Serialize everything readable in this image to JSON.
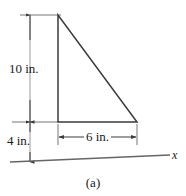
{
  "figure": {
    "caption": "(a)",
    "axis_label": "x",
    "shape": "right triangle",
    "dimensions": [
      {
        "id": "height",
        "label": "10 in.",
        "value": 10,
        "unit": "in.",
        "orientation": "vertical"
      },
      {
        "id": "offset",
        "label": "4 in.",
        "value": 4,
        "unit": "in.",
        "orientation": "vertical"
      },
      {
        "id": "base",
        "label": "6 in.",
        "value": 6,
        "unit": "in.",
        "orientation": "horizontal"
      }
    ],
    "colors": {
      "outline": "#3a3a3a",
      "dimension_line": "#555555",
      "text": "#1a1a1a",
      "background": "#ffffff"
    },
    "geometry": {
      "apex": [
        58,
        15
      ],
      "bottom_left": [
        58,
        122
      ],
      "bottom_right": [
        137,
        122
      ],
      "axis_start": [
        10,
        162
      ],
      "axis_end": [
        170,
        155
      ]
    }
  }
}
